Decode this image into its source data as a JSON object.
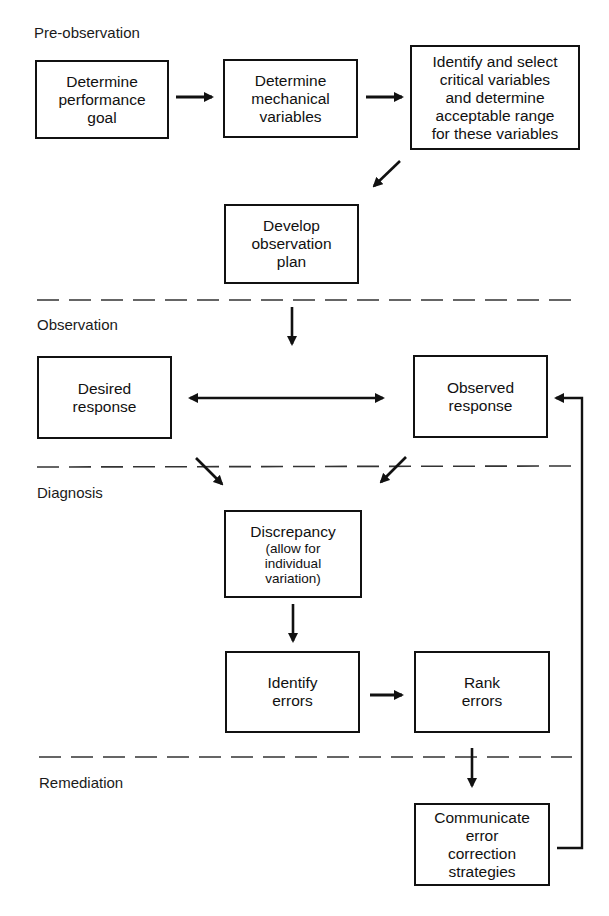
{
  "diagram": {
    "type": "flowchart",
    "phases": [
      {
        "id": "pre-observation",
        "label": "Pre-observation"
      },
      {
        "id": "observation",
        "label": "Observation"
      },
      {
        "id": "diagnosis",
        "label": "Diagnosis"
      },
      {
        "id": "remediation",
        "label": "Remediation"
      }
    ],
    "nodes": {
      "determine_goal": {
        "lines": [
          "Determine",
          "performance",
          "goal"
        ]
      },
      "mechanical_variables": {
        "lines": [
          "Determine",
          "mechanical",
          "variables"
        ]
      },
      "critical_variables": {
        "lines": [
          "Identify and select",
          "critical variables",
          "and determine",
          "acceptable range",
          "for these variables"
        ]
      },
      "observation_plan": {
        "lines": [
          "Develop",
          "observation",
          "plan"
        ]
      },
      "desired_response": {
        "lines": [
          "Desired",
          "response"
        ]
      },
      "observed_response": {
        "lines": [
          "Observed",
          "response"
        ]
      },
      "discrepancy": {
        "title": "Discrepancy",
        "lines": [
          "(allow for",
          "individual",
          "variation)"
        ]
      },
      "identify_errors": {
        "lines": [
          "Identify",
          "errors"
        ]
      },
      "rank_errors": {
        "lines": [
          "Rank",
          "errors"
        ]
      },
      "communicate": {
        "lines": [
          "Communicate",
          "error",
          "correction",
          "strategies"
        ]
      }
    },
    "edges": [
      {
        "from": "determine_goal",
        "to": "mechanical_variables"
      },
      {
        "from": "mechanical_variables",
        "to": "critical_variables"
      },
      {
        "from": "critical_variables",
        "to": "observation_plan"
      },
      {
        "from": "observation_plan",
        "to": "observation_phase"
      },
      {
        "from": "desired_response",
        "to": "observed_response",
        "bidirectional": true
      },
      {
        "from": "desired_response",
        "to": "discrepancy"
      },
      {
        "from": "observed_response",
        "to": "discrepancy"
      },
      {
        "from": "discrepancy",
        "to": "identify_errors"
      },
      {
        "from": "identify_errors",
        "to": "rank_errors"
      },
      {
        "from": "rank_errors",
        "to": "communicate"
      },
      {
        "from": "communicate",
        "to": "observed_response",
        "feedback": true
      }
    ]
  }
}
